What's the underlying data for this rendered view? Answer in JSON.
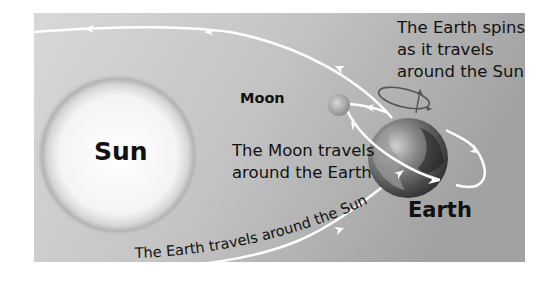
{
  "diagram": {
    "type": "sun-earth-moon-orbit",
    "colors": {
      "background_light": "#d9d9d9",
      "background_dark": "#a5a5a5",
      "orbit_line": "#ffffff",
      "text": "#111111",
      "sun_core": "#ffffff",
      "sun_ring": "#b5b5b5"
    },
    "bodies": {
      "sun": {
        "label": "Sun"
      },
      "moon": {
        "label": "Moon"
      },
      "earth": {
        "label": "Earth"
      }
    },
    "captions": {
      "moon_orbit": [
        "The Moon travels",
        "around the Earth"
      ],
      "earth_spin": [
        "The Earth spins",
        "as it travels",
        "around the Sun"
      ],
      "earth_orbit": "The Earth travels around the Sun"
    }
  }
}
